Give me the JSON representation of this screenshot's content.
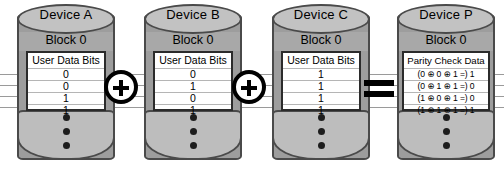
{
  "diagram": {
    "colors": {
      "cylinder_body": "#9d9d9d",
      "cylinder_top": "#c2c2c2",
      "cylinder_bottom": "#bdbdbd",
      "band": "#a8a8a8",
      "outline": "#4a4a4a",
      "box_border": "#2b2b2b",
      "line": "#9a9a9a",
      "text": "#000000"
    },
    "devices": [
      {
        "name": "Device A",
        "block": "Block 0",
        "data_header": "User Data Bits",
        "rows": [
          "0",
          "0",
          "1",
          "1"
        ],
        "ellipsis_dots": 3
      },
      {
        "name": "Device B",
        "block": "Block 0",
        "data_header": "User Data Bits",
        "rows": [
          "0",
          "1",
          "0",
          "1"
        ],
        "ellipsis_dots": 3
      },
      {
        "name": "Device C",
        "block": "Block 0",
        "data_header": "User Data Bits",
        "rows": [
          "1",
          "1",
          "1",
          "1"
        ],
        "ellipsis_dots": 3
      },
      {
        "name": "Device P",
        "block": "Block 0",
        "data_header": "Parity Check Data",
        "rows": [
          "(0 ⊕ 0 ⊕ 1 =) 1",
          "(0 ⊕ 1 ⊕ 1 =) 0",
          "(1 ⊕ 0 ⊕ 1 =) 0",
          "(1 ⊕ 1 ⊕ 1 =) 1"
        ],
        "ellipsis_dots": 3
      }
    ],
    "operators": [
      {
        "symbol": "⊕",
        "name": "xor-operator-a-b"
      },
      {
        "symbol": "⊕",
        "name": "xor-operator-b-c"
      },
      {
        "symbol": "=",
        "name": "equals-operator"
      }
    ]
  }
}
